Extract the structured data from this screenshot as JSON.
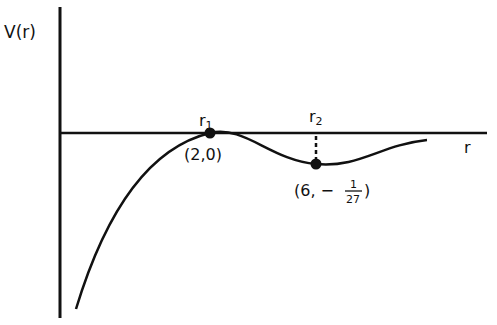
{
  "diagram": {
    "y_axis_label": "V(r)",
    "x_axis_label": "r",
    "points": [
      {
        "name": "r1",
        "label_main": "r",
        "label_sub": "1",
        "coord_label": "(2,0)"
      },
      {
        "name": "r2",
        "label_main": "r",
        "label_sub": "2",
        "coord_open": "(6, −",
        "frac_num": "1",
        "frac_den": "27",
        "coord_close": ")"
      }
    ],
    "colors": {
      "ink": "#111111",
      "background": "#ffffff"
    }
  }
}
